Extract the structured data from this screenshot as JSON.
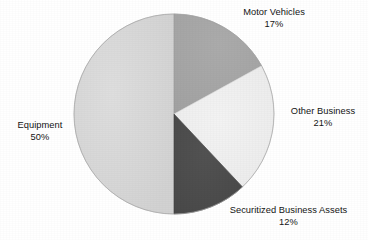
{
  "chart_data": {
    "type": "pie",
    "title": "",
    "subtitle": "",
    "xlabel": "",
    "ylabel": "",
    "legend_position": "outside-labels",
    "grid": false,
    "start_angle_deg": 0,
    "direction": "clockwise",
    "unit": "%",
    "categories": [
      "Motor Vehicles",
      "Other Business",
      "Securitized Business Assets",
      "Equipment"
    ],
    "values": [
      17,
      21,
      12,
      50
    ],
    "slices": [
      {
        "name": "Motor Vehicles",
        "value": 17,
        "value_label": "17%",
        "color": "#a8a8a8",
        "label_position": "top-right"
      },
      {
        "name": "Other Business",
        "value": 21,
        "value_label": "21%",
        "color": "#f0f0f0",
        "label_position": "right"
      },
      {
        "name": "Securitized Business Assets",
        "value": 12,
        "value_label": "12%",
        "color": "#4e4e4e",
        "label_position": "bottom-right"
      },
      {
        "name": "Equipment",
        "value": 50,
        "value_label": "50%",
        "color": "#d8d8d8",
        "label_position": "left"
      }
    ],
    "geometry": {
      "center_x": 174,
      "center_y": 114,
      "radius": 100
    },
    "colors": {
      "background": "#ffffff",
      "text": "#141414",
      "outline": "#9a9a9a"
    }
  }
}
